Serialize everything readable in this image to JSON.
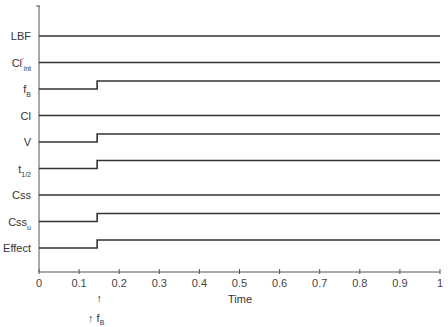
{
  "chart_data": {
    "type": "line",
    "title": "",
    "xlabel": "Time",
    "ylabel": "",
    "xlim": [
      0,
      1
    ],
    "x_ticks": [
      "0",
      "0.1",
      "0.2",
      "0.3",
      "0.4",
      "0.5",
      "0.6",
      "0.7",
      "0.8",
      "0.9",
      "1"
    ],
    "grid": false,
    "legend": "none",
    "step_time": 0.145,
    "annotations": [
      {
        "text": "↑",
        "x": 0.145,
        "position": "below-axis-upper"
      },
      {
        "text": "↑ f",
        "sub": "B",
        "x": 0.12,
        "position": "below-axis-lower"
      }
    ],
    "series": [
      {
        "name": "LBF",
        "label_main": "LBF",
        "label_sub": "",
        "label_sup": "",
        "change": "none",
        "values": [
          {
            "x": 0,
            "y": 0
          },
          {
            "x": 1,
            "y": 0
          }
        ]
      },
      {
        "name": "CI'int",
        "label_main": "Cl",
        "label_sup": "'",
        "label_sub": "int",
        "change": "none",
        "values": [
          {
            "x": 0,
            "y": 0
          },
          {
            "x": 1,
            "y": 0
          }
        ]
      },
      {
        "name": "fB",
        "label_main": "f",
        "label_sub": "B",
        "label_sup": "",
        "change": "increase",
        "values": [
          {
            "x": 0,
            "y": 0
          },
          {
            "x": 0.145,
            "y": 0
          },
          {
            "x": 0.145,
            "y": 1
          },
          {
            "x": 1,
            "y": 1
          }
        ]
      },
      {
        "name": "Cl",
        "label_main": "Cl",
        "label_sub": "",
        "label_sup": "",
        "change": "none",
        "values": [
          {
            "x": 0,
            "y": 0
          },
          {
            "x": 1,
            "y": 0
          }
        ]
      },
      {
        "name": "V",
        "label_main": "V",
        "label_sub": "",
        "label_sup": "",
        "change": "increase",
        "values": [
          {
            "x": 0,
            "y": 0
          },
          {
            "x": 0.145,
            "y": 0
          },
          {
            "x": 0.145,
            "y": 1
          },
          {
            "x": 1,
            "y": 1
          }
        ]
      },
      {
        "name": "t1/2",
        "label_main": "t",
        "label_sub": "1/2",
        "label_sup": "",
        "change": "increase",
        "values": [
          {
            "x": 0,
            "y": 0
          },
          {
            "x": 0.145,
            "y": 0
          },
          {
            "x": 0.145,
            "y": 1
          },
          {
            "x": 1,
            "y": 1
          }
        ]
      },
      {
        "name": "Css",
        "label_main": "Css",
        "label_sub": "",
        "label_sup": "",
        "change": "none",
        "values": [
          {
            "x": 0,
            "y": 0
          },
          {
            "x": 1,
            "y": 0
          }
        ]
      },
      {
        "name": "Cssu",
        "label_main": "Css",
        "label_sub": "u",
        "label_sup": "",
        "change": "increase",
        "values": [
          {
            "x": 0,
            "y": 0
          },
          {
            "x": 0.145,
            "y": 0
          },
          {
            "x": 0.145,
            "y": 1
          },
          {
            "x": 1,
            "y": 1
          }
        ]
      },
      {
        "name": "Effect",
        "label_main": "Effect",
        "label_sub": "",
        "label_sup": "",
        "change": "increase",
        "values": [
          {
            "x": 0,
            "y": 0
          },
          {
            "x": 0.145,
            "y": 0
          },
          {
            "x": 0.145,
            "y": 1
          },
          {
            "x": 1,
            "y": 1
          }
        ]
      }
    ]
  },
  "colors": {
    "line": "#333333",
    "axis": "#555555",
    "text": "#333333"
  }
}
